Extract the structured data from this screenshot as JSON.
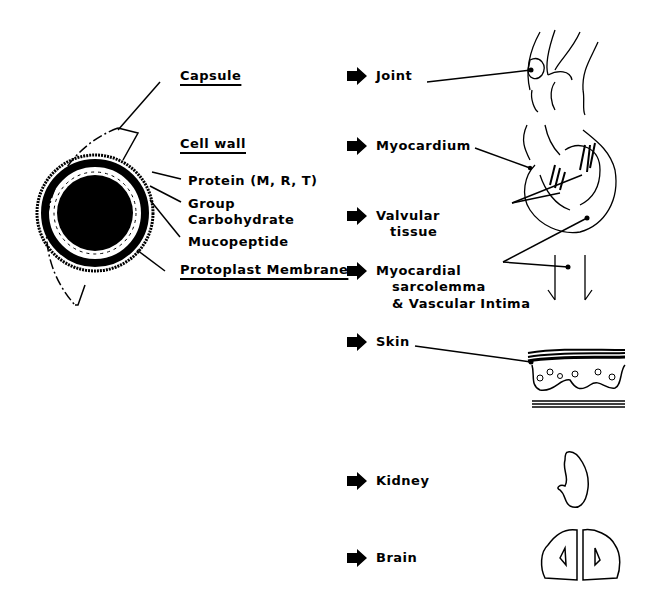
{
  "cell_structure": {
    "layers": {
      "capsule": "Capsule",
      "cell_wall": "Cell wall",
      "protein": "Protein (M, R, T)",
      "group_carbohydrate_1": "Group",
      "group_carbohydrate_2": "Carbohydrate",
      "mucopeptide": "Mucopeptide",
      "protoplast_membrane": "Protoplast Membrane"
    }
  },
  "target_tissues": [
    {
      "label": "Joint"
    },
    {
      "label": "Myocardium"
    },
    {
      "label_1": "Valvular",
      "label_2": "tissue"
    },
    {
      "label_1": "Myocardial",
      "label_2": "sarcolemma",
      "label_3": "& Vascular Intima"
    },
    {
      "label": "Skin"
    },
    {
      "label": "Kidney"
    },
    {
      "label": "Brain"
    }
  ]
}
